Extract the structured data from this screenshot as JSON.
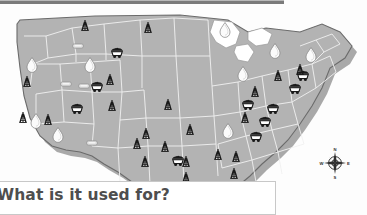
{
  "page": {
    "background_color": "#fdfdfd",
    "rule_color": "#7b7b7b"
  },
  "caption": {
    "text": "What is it used for?",
    "clipped_left": true,
    "box_border_color": "#c8c8c8",
    "box_background": "#ffffff"
  },
  "map": {
    "name": "united-states-outline",
    "land_fill": "#b3b3b3",
    "land_stroke": "#6e6e6e",
    "state_border_color": "#f2f2f2",
    "shadow_color": "#8c8c8c",
    "lake_fill": "#ffffff"
  },
  "legend_symbols": [
    {
      "id": "oil-derrick",
      "label": "Oil derrick",
      "color": "#1a1a1a"
    },
    {
      "id": "coal-cart",
      "label": "Coal cart",
      "color": "#1a1a1a"
    },
    {
      "id": "gas-droplet",
      "label": "Natural gas droplet",
      "color": "#ffffff"
    },
    {
      "id": "mineral-pill",
      "label": "Mineral deposit",
      "color": "#d8d8d8"
    }
  ],
  "compass": {
    "name": "compass-rose",
    "north": "N",
    "south": "S",
    "east": "E",
    "west": "W"
  },
  "symbols": {
    "oil_derricks": [
      {
        "x": 85,
        "y": 24
      },
      {
        "x": 148,
        "y": 26
      },
      {
        "x": 27,
        "y": 80
      },
      {
        "x": 110,
        "y": 78
      },
      {
        "x": 23,
        "y": 116
      },
      {
        "x": 48,
        "y": 118
      },
      {
        "x": 112,
        "y": 104
      },
      {
        "x": 168,
        "y": 103
      },
      {
        "x": 146,
        "y": 132
      },
      {
        "x": 190,
        "y": 128
      },
      {
        "x": 137,
        "y": 142
      },
      {
        "x": 165,
        "y": 145
      },
      {
        "x": 145,
        "y": 160
      },
      {
        "x": 186,
        "y": 160
      },
      {
        "x": 218,
        "y": 153
      },
      {
        "x": 236,
        "y": 155
      },
      {
        "x": 234,
        "y": 172
      },
      {
        "x": 186,
        "y": 176
      },
      {
        "x": 160,
        "y": 188
      },
      {
        "x": 255,
        "y": 90
      },
      {
        "x": 245,
        "y": 116
      },
      {
        "x": 278,
        "y": 74
      },
      {
        "x": 300,
        "y": 68
      }
    ],
    "coal_carts": [
      {
        "x": 117,
        "y": 48
      },
      {
        "x": 97,
        "y": 82
      },
      {
        "x": 77,
        "y": 104
      },
      {
        "x": 248,
        "y": 100
      },
      {
        "x": 273,
        "y": 104
      },
      {
        "x": 265,
        "y": 117
      },
      {
        "x": 256,
        "y": 132
      },
      {
        "x": 303,
        "y": 71
      },
      {
        "x": 295,
        "y": 84
      },
      {
        "x": 178,
        "y": 156
      }
    ],
    "gas_droplets": [
      {
        "x": 32,
        "y": 60
      },
      {
        "x": 90,
        "y": 60
      },
      {
        "x": 36,
        "y": 116
      },
      {
        "x": 58,
        "y": 130
      },
      {
        "x": 225,
        "y": 25
      },
      {
        "x": 243,
        "y": 69
      },
      {
        "x": 275,
        "y": 46
      },
      {
        "x": 311,
        "y": 50
      },
      {
        "x": 228,
        "y": 126
      }
    ],
    "mineral_pills": [
      {
        "x": 78,
        "y": 40
      },
      {
        "x": 66,
        "y": 78
      },
      {
        "x": 84,
        "y": 80
      },
      {
        "x": 92,
        "y": 137
      }
    ]
  }
}
